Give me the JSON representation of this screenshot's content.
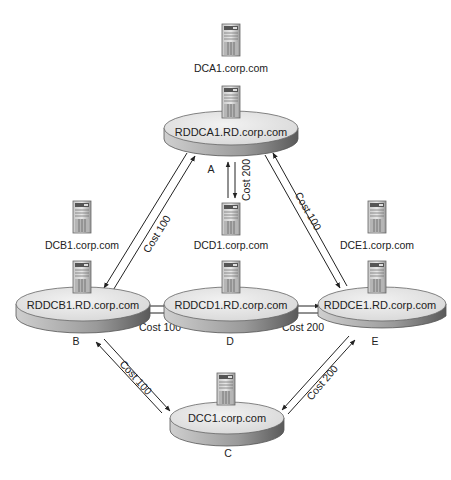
{
  "diagram": {
    "sites": [
      {
        "id": "A",
        "name": "RDDCA1.RD.corp.com",
        "letter": "A",
        "dc": "DCA1.corp.com"
      },
      {
        "id": "B",
        "name": "RDDCB1.RD.corp.com",
        "letter": "B",
        "dc": "DCB1.corp.com"
      },
      {
        "id": "C",
        "name": "DCC1.corp.com",
        "letter": "C"
      },
      {
        "id": "D",
        "name": "RDDCD1.RD.corp.com",
        "letter": "D",
        "dc": "DCD1.corp.com"
      },
      {
        "id": "E",
        "name": "RDDCE1.RD.corp.com",
        "letter": "E",
        "dc": "DCE1.corp.com"
      }
    ],
    "links": [
      {
        "from": "A",
        "to": "B",
        "cost": "Cost 100"
      },
      {
        "from": "A",
        "to": "D",
        "cost": "Cost 200"
      },
      {
        "from": "A",
        "to": "E",
        "cost": "Cost 100"
      },
      {
        "from": "B",
        "to": "D",
        "cost": "Cost 100"
      },
      {
        "from": "D",
        "to": "E",
        "cost": "Cost 200"
      },
      {
        "from": "B",
        "to": "C",
        "cost": "Cost 100"
      },
      {
        "from": "E",
        "to": "C",
        "cost": "Cost 200"
      }
    ],
    "colors": {
      "disk_top": "#e6e6e6",
      "disk_side": "#8c8c8c",
      "line": "#222222"
    }
  }
}
